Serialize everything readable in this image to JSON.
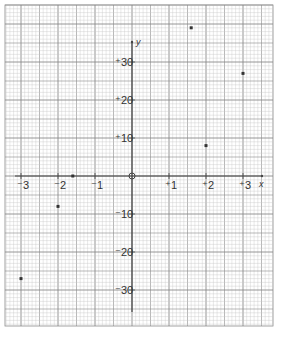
{
  "chart_data": {
    "type": "scatter",
    "title": "",
    "xlabel": "x",
    "ylabel": "y",
    "xlim": [
      -3.4,
      3.8
    ],
    "ylim": [
      -39,
      45
    ],
    "grid": true,
    "x_ticks": [
      {
        "value": -3,
        "label": "⁻3"
      },
      {
        "value": -2,
        "label": "⁻2"
      },
      {
        "value": -1,
        "label": "⁻1"
      },
      {
        "value": 1,
        "label": "⁺1"
      },
      {
        "value": 2,
        "label": "⁺2"
      },
      {
        "value": 3,
        "label": "⁺3"
      }
    ],
    "y_ticks": [
      {
        "value": 30,
        "label": "⁺30"
      },
      {
        "value": 20,
        "label": "⁺20"
      },
      {
        "value": 10,
        "label": "⁺10"
      },
      {
        "value": -10,
        "label": "⁻10"
      },
      {
        "value": -20,
        "label": "⁻20"
      },
      {
        "value": -30,
        "label": "⁻30"
      }
    ],
    "origin_label": "0",
    "series": [
      {
        "name": "points",
        "x": [
          -3,
          -2,
          -1.6,
          2,
          3,
          1.6
        ],
        "y": [
          -27,
          -8,
          0,
          8,
          27,
          39
        ]
      }
    ]
  },
  "layout": {
    "grid_left": 5,
    "grid_top": 5,
    "grid_right": 273,
    "grid_bottom": 326,
    "origin_x": 132,
    "origin_y": 176,
    "px_per_x": 37,
    "px_per_y10": 38,
    "minor_px": 3.7,
    "colors": {
      "minor": "#c8c8c8",
      "major": "#8a8a8a",
      "axis": "#444444",
      "point": "#333333"
    }
  }
}
